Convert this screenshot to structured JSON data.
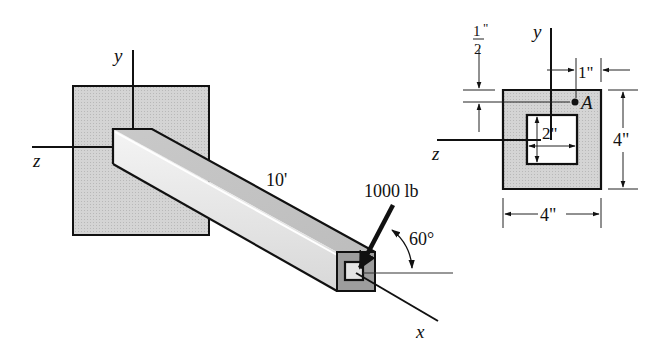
{
  "figure": {
    "left_view": {
      "axis_labels": {
        "y": "y",
        "z": "z",
        "x": "x"
      },
      "length_label": "10'",
      "force_label": "1000 lb",
      "angle_label": "60°"
    },
    "cross_section": {
      "axis_labels": {
        "y": "y",
        "z": "z"
      },
      "point_label": "A",
      "dim_half_num": "1",
      "dim_half_den": "2",
      "dim_half_unit": "\"",
      "dim_1in": "1\"",
      "dim_height": "4\"",
      "dim_width": "4\"",
      "dim_inner": "2\""
    },
    "colors": {
      "wall_fill": "#cfcfcf",
      "beam_top": "#c4c4c4",
      "beam_side": "#e6e6e6",
      "end_face": "#9a9a9a",
      "section_fill": "#d6d6d6",
      "line": "#111111"
    }
  }
}
